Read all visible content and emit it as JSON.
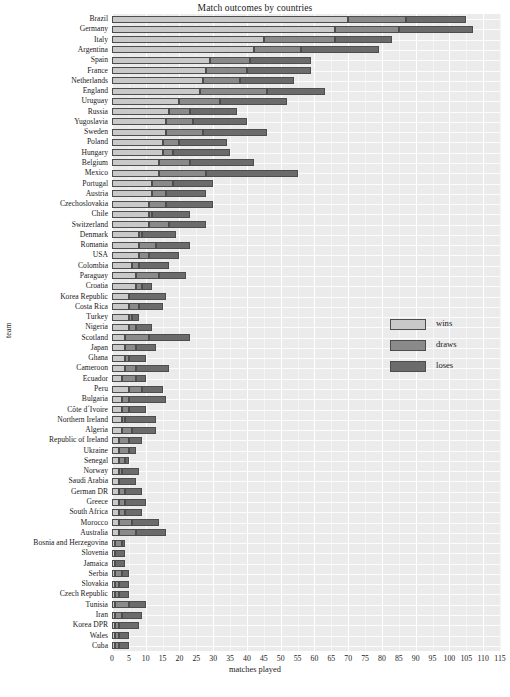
{
  "chart_data": {
    "type": "bar",
    "orientation": "horizontal",
    "stacked": true,
    "title": "Match outcomes by countries",
    "xlabel": "matches played",
    "ylabel": "team",
    "xlim": [
      0,
      115
    ],
    "xticks": [
      0,
      5,
      10,
      15,
      20,
      25,
      30,
      35,
      40,
      45,
      50,
      55,
      60,
      65,
      70,
      75,
      80,
      85,
      90,
      95,
      100,
      105,
      110,
      115
    ],
    "grid": true,
    "legend_position": "right-middle",
    "legend": [
      "wins",
      "draws",
      "loses"
    ],
    "series": [
      {
        "name": "wins",
        "color": "#c9c9c9"
      },
      {
        "name": "draws",
        "color": "#8a8a8a"
      },
      {
        "name": "loses",
        "color": "#6b6b6b"
      }
    ],
    "categories": [
      "Brazil",
      "Germany",
      "Italy",
      "Argentina",
      "Spain",
      "France",
      "Netherlands",
      "England",
      "Uruguay",
      "Russia",
      "Yugoslavia",
      "Sweden",
      "Poland",
      "Hungary",
      "Belgium",
      "Mexico",
      "Portugal",
      "Austria",
      "Czechoslovakia",
      "Chile",
      "Switzerland",
      "Denmark",
      "Romania",
      "USA",
      "Colombia",
      "Paraguay",
      "Croatia",
      "Korea Republic",
      "Costa Rica",
      "Turkey",
      "Nigeria",
      "Scotland",
      "Japan",
      "Ghana",
      "Cameroon",
      "Ecuador",
      "Peru",
      "Bulgaria",
      "Côte d´Ivoire",
      "Northern Ireland",
      "Algeria",
      "Republic of Ireland",
      "Ukraine",
      "Senegal",
      "Norway",
      "Saudi Arabia",
      "German DR",
      "Greece",
      "South Africa",
      "Morocco",
      "Australia",
      "Bosnia and Herzegovina",
      "Slovenia",
      "Jamaica",
      "Serbia",
      "Slovakia",
      "Czech Republic",
      "Tunisia",
      "Iran",
      "Korea DPR",
      "Wales",
      "Cuba"
    ],
    "values": {
      "wins": [
        70,
        66,
        45,
        42,
        29,
        28,
        27,
        26,
        20,
        17,
        16,
        16,
        15,
        15,
        14,
        14,
        12,
        12,
        11,
        11,
        11,
        8,
        8,
        8,
        6,
        7,
        7,
        5,
        5,
        5,
        5,
        4,
        4,
        4,
        4,
        3,
        5,
        3,
        3,
        3,
        3,
        2,
        2,
        2,
        2,
        2,
        2,
        2,
        2,
        2,
        2,
        1,
        1,
        1,
        1,
        1,
        1,
        1,
        1,
        1,
        1,
        1
      ],
      "draws": [
        17,
        19,
        21,
        14,
        12,
        12,
        11,
        20,
        12,
        6,
        8,
        11,
        5,
        3,
        9,
        14,
        6,
        4,
        5,
        1,
        6,
        1,
        5,
        3,
        2,
        7,
        2,
        0,
        3,
        1,
        2,
        7,
        3,
        1,
        3,
        4,
        4,
        2,
        2,
        1,
        3,
        3,
        3,
        2,
        1,
        0,
        2,
        2,
        2,
        4,
        5,
        2,
        0,
        0,
        2,
        1,
        1,
        4,
        2,
        1,
        1,
        1
      ],
      "loses": [
        18,
        22,
        17,
        23,
        18,
        19,
        16,
        17,
        20,
        14,
        16,
        19,
        14,
        17,
        19,
        27,
        12,
        12,
        14,
        11,
        11,
        10,
        10,
        9,
        9,
        8,
        3,
        11,
        7,
        2,
        5,
        12,
        6,
        5,
        10,
        3,
        6,
        11,
        5,
        9,
        7,
        4,
        2,
        1,
        5,
        5,
        5,
        6,
        5,
        8,
        9,
        1,
        3,
        3,
        2,
        3,
        3,
        5,
        6,
        6,
        3,
        3
      ]
    }
  },
  "legend": {
    "items": [
      {
        "label": "wins",
        "color": "#c9c9c9"
      },
      {
        "label": "draws",
        "color": "#8a8a8a"
      },
      {
        "label": "loses",
        "color": "#6b6b6b"
      }
    ]
  },
  "axes": {
    "x_title": "matches played",
    "y_title": "team"
  },
  "title": "Match outcomes by countries"
}
